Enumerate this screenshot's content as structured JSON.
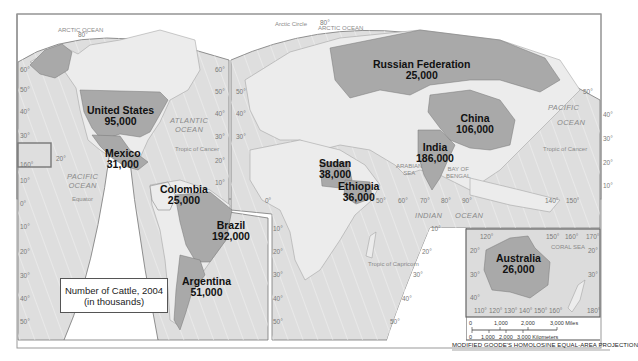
{
  "map": {
    "title": "Number of Cattle, 2004",
    "subtitle": "(in thousands)",
    "projection": "MODIFIED GOODE'S HOMOLOSINE EQUAL-AREA PROJECTION",
    "colors": {
      "highlight": "#a9a9a9",
      "land": "#e9e9e9",
      "ocean": "#dcdcdc",
      "border": "#666666"
    },
    "countries": [
      {
        "name": "United States",
        "value": "95,000"
      },
      {
        "name": "Mexico",
        "value": "31,000"
      },
      {
        "name": "Colombia",
        "value": "25,000"
      },
      {
        "name": "Brazil",
        "value": "192,000"
      },
      {
        "name": "Argentina",
        "value": "51,000"
      },
      {
        "name": "Russian Federation",
        "value": "25,000"
      },
      {
        "name": "China",
        "value": "106,000"
      },
      {
        "name": "India",
        "value": "186,000"
      },
      {
        "name": "Sudan",
        "value": "38,000"
      },
      {
        "name": "Ethiopia",
        "value": "36,000"
      },
      {
        "name": "Australia",
        "value": "26,000"
      }
    ],
    "water_labels": {
      "arctic_ocean_1": "ARCTIC OCEAN",
      "arctic_ocean_2": "ARCTIC OCEAN",
      "atlantic_1": "ATLANTIC",
      "atlantic_2": "OCEAN",
      "pacific_w_1": "PACIFIC",
      "pacific_w_2": "OCEAN",
      "pacific_e_1": "PACIFIC",
      "pacific_e_2": "OCEAN",
      "indian": "INDIAN",
      "indian_ocean": "OCEAN",
      "arabian_1": "ARABIAN",
      "arabian_2": "SEA",
      "bengal_1": "BAY OF",
      "bengal_2": "BENGAL",
      "coral_sea": "CORAL SEA"
    },
    "lines": {
      "tropic_cancer_w": "Tropic of Cancer",
      "tropic_cancer_e": "Tropic of Cancer",
      "tropic_capricorn": "Tropic of Capricorn",
      "equator": "Equator",
      "arctic_circle": "Arctic Circle"
    },
    "scale": {
      "miles": [
        "0",
        "1,000",
        "2,000",
        "3,000 Miles"
      ],
      "km": [
        "0",
        "1,000",
        "2,000",
        "3,000 Kilometers"
      ]
    },
    "degrees": {
      "left_lats": [
        "60°",
        "50°",
        "40°",
        "30°",
        "10°",
        "0°",
        "10°",
        "20°",
        "30°",
        "40°",
        "50°"
      ],
      "americas_right": [
        "60°",
        "50°",
        "40°",
        "30°",
        "20°",
        "10°"
      ],
      "hawaii": [
        "20°",
        "160°"
      ],
      "europe_left": [
        "50°",
        "40°",
        "30°",
        "0°",
        "10°",
        "20°",
        "30°",
        "40°",
        "50°"
      ],
      "africa_south_right": [
        "10°",
        "20°",
        "30°",
        "40°",
        "50°"
      ],
      "lon_row": [
        "50°",
        "60°",
        "70°",
        "80°",
        "90°",
        "140°",
        "150°"
      ],
      "pacific_right": [
        "50°",
        "40°",
        "30°",
        "20°",
        "10°"
      ],
      "australia_top": [
        "120°",
        "150°",
        "160°",
        "170°"
      ],
      "australia_bottom": [
        "110°",
        "120°",
        "130°",
        "140°",
        "150°",
        "160°",
        "180°"
      ],
      "australia_lats_left": [
        "20°",
        "30°",
        "40°"
      ],
      "australia_lats_right": [
        "20°",
        "30°"
      ],
      "top_80": "80°",
      "top_80b": "80°"
    }
  }
}
